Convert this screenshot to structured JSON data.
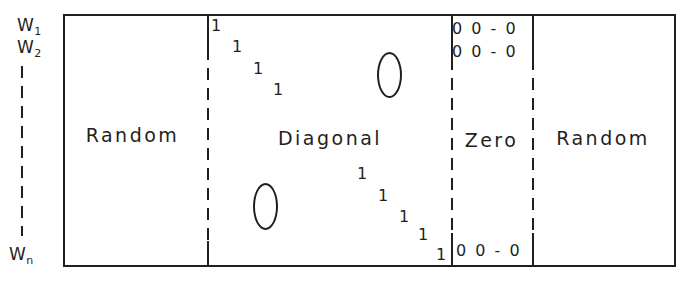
{
  "figure": {
    "colors": {
      "ink": "#1f1f1f",
      "background": "#ffffff"
    },
    "row_labels": [
      {
        "base": "W",
        "sub": "1"
      },
      {
        "base": "W",
        "sub": "2"
      },
      {
        "base": "W",
        "sub": "n"
      }
    ],
    "blocks": {
      "left_random": "Random",
      "diagonal": "Diagonal",
      "zero": "Zero",
      "right_random": "Random"
    },
    "diagonal_ones": {
      "top": [
        "1",
        "1",
        "1",
        "1"
      ],
      "bottom": [
        "1",
        "1",
        "1",
        "1",
        "1"
      ]
    },
    "zero_entries": {
      "top_row_1": "0 0 - 0",
      "top_row_2": "0 0 - 0",
      "bottom_row": "0 0 - 0"
    }
  }
}
